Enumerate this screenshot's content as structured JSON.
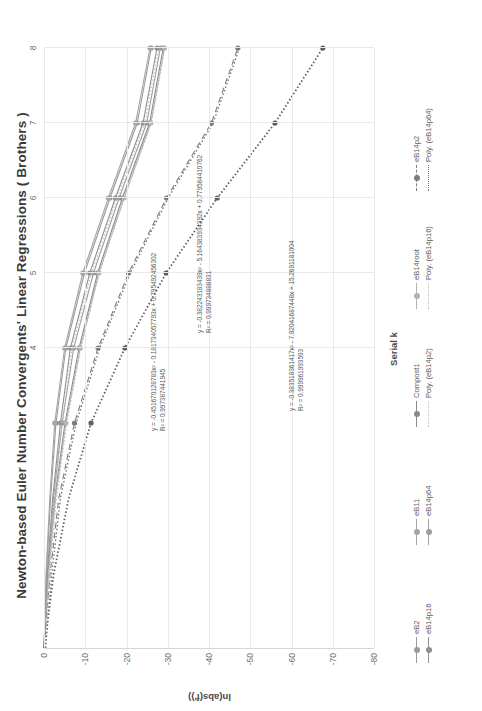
{
  "chart_data": {
    "type": "line",
    "title": "Newton-based Euler Number Convergents' Linear Regressions ( Brothers )",
    "xlabel": "Serial k",
    "ylabel": "ln(abs(f'))",
    "xlim": [
      0,
      8
    ],
    "ylim": [
      -80,
      0
    ],
    "xticks": [
      "4",
      "5",
      "6",
      "7",
      "8"
    ],
    "yticks": [
      "0",
      "-10",
      "-20",
      "-30",
      "-40",
      "-50",
      "-60",
      "-70",
      "-80"
    ],
    "grid": true,
    "legend_position": "bottom",
    "x": [
      0,
      1,
      2,
      3,
      4,
      5,
      6,
      7,
      8
    ],
    "series": [
      {
        "name": "eB2",
        "color": "#9a9a9a",
        "style": "solid",
        "marker": "circle",
        "values": [
          0,
          -0.6,
          -1.6,
          -2.9,
          -5.3,
          -9.8,
          -16.0,
          -22.6,
          -26.0
        ]
      },
      {
        "name": "eB11",
        "color": "#a5a5a5",
        "style": "solid",
        "marker": "circle",
        "values": [
          0,
          -0.5,
          -1.4,
          -2.6,
          -5.0,
          -9.4,
          -15.6,
          -22.2,
          -25.7
        ]
      },
      {
        "name": "eB14p16",
        "color": "#8f8f8f",
        "style": "solid",
        "marker": "circle",
        "values": [
          0,
          -0.8,
          -2.1,
          -4.0,
          -6.4,
          -11.1,
          -17.3,
          -24.0,
          -27.4
        ]
      },
      {
        "name": "eB14p64",
        "color": "#9e9e9e",
        "style": "solid",
        "marker": "circle",
        "values": [
          0,
          -0.9,
          -2.3,
          -4.4,
          -7.2,
          -12.0,
          -18.2,
          -24.9,
          -28.2
        ]
      },
      {
        "name": "Compost1",
        "color": "#8a8a8a",
        "style": "solid",
        "marker": "circle",
        "values": [
          0,
          -1.0,
          -2.6,
          -5.1,
          -8.5,
          -13.0,
          -19.0,
          -25.6,
          -28.9
        ]
      },
      {
        "name": "eB14root",
        "color": "#b3b3b3",
        "style": "solid",
        "marker": "circle",
        "values": [
          0,
          -1.1,
          -2.8,
          -5.3,
          -8.8,
          -13.3,
          -19.4,
          -25.9,
          -29.2
        ]
      },
      {
        "name": "eB14p2",
        "color": "#7d7d7d",
        "style": "dashed",
        "marker": "circle",
        "values": [
          0,
          -1.5,
          -3.6,
          -7.4,
          -13.1,
          -20.5,
          -29.7,
          -40.6,
          -47.0
        ]
      }
    ],
    "trendlines": [
      {
        "name": "Poly. (eB14p2)",
        "color": "#c2c2c2",
        "style": "dotted",
        "equation": "y = -0.451670128783x² - 0.181734057793x + 0.795492456302",
        "r2": "R² = 0.997387441945"
      },
      {
        "name": "Poly. (eB14p16)",
        "color": "#bdbdbd",
        "style": "dotted",
        "equation": "y = -0.382243183x² - 5.16438393439 2x + 0.779584410762",
        "r2": "R² = 0.999734888831"
      },
      {
        "name": "Poly. (eB14p64)",
        "color": "#6f6f6f",
        "style": "dotted",
        "equation": "y = -0.383518361417x² - 7.92041687448x + 15.2691181004",
        "r2": "R² = 0.999961993593"
      }
    ],
    "bottom_trend_series": {
      "name": "bottom-dotted-curve",
      "color": "#5e5e5e",
      "values": [
        0,
        -2.4,
        -6.0,
        -11.4,
        -19.6,
        -29.6,
        -42.0,
        -56.0,
        -67.6
      ]
    },
    "annotations": [
      {
        "id": "eq1",
        "equation": "y = -0.451670128783x² - 0.181734057793x + 0.795492456302",
        "r2": "R² = 0.997387441945"
      },
      {
        "id": "eq2",
        "equation": "y = -0.382243183439x² - 5.164383934392x + 0.779584410762",
        "r2": "R² = 0.999734888831"
      },
      {
        "id": "eq3",
        "equation": "y = -0.383518361417x² - 7.92041687448x + 15.2691181004",
        "r2": "R² = 0.999961993593"
      }
    ],
    "legend": [
      {
        "label": "eB2",
        "color": "#9a9a9a",
        "style": "solid",
        "marker": true
      },
      {
        "label": "eB11",
        "color": "#a5a5a5",
        "style": "solid",
        "marker": true
      },
      {
        "label": "Compost1",
        "color": "#8a8a8a",
        "style": "solid",
        "marker": true
      },
      {
        "label": "eB14root",
        "color": "#b3b3b3",
        "style": "solid",
        "marker": true
      },
      {
        "label": "eB14p2",
        "color": "#7d7d7d",
        "style": "dashed",
        "marker": true
      },
      {
        "label": "eB14p16",
        "color": "#8f8f8f",
        "style": "solid",
        "marker": true
      },
      {
        "label": "eB14p64",
        "color": "#9e9e9e",
        "style": "solid",
        "marker": true
      },
      {
        "label": "Poly. (eB14p2)",
        "color": "#c2c2c2",
        "style": "dotted",
        "marker": false
      },
      {
        "label": "Poly. (eB14p16)",
        "color": "#bdbdbd",
        "style": "dotted",
        "marker": false
      },
      {
        "label": "Poly. (eB14p64)",
        "color": "#6f6f6f",
        "style": "dotted",
        "marker": false
      }
    ]
  }
}
